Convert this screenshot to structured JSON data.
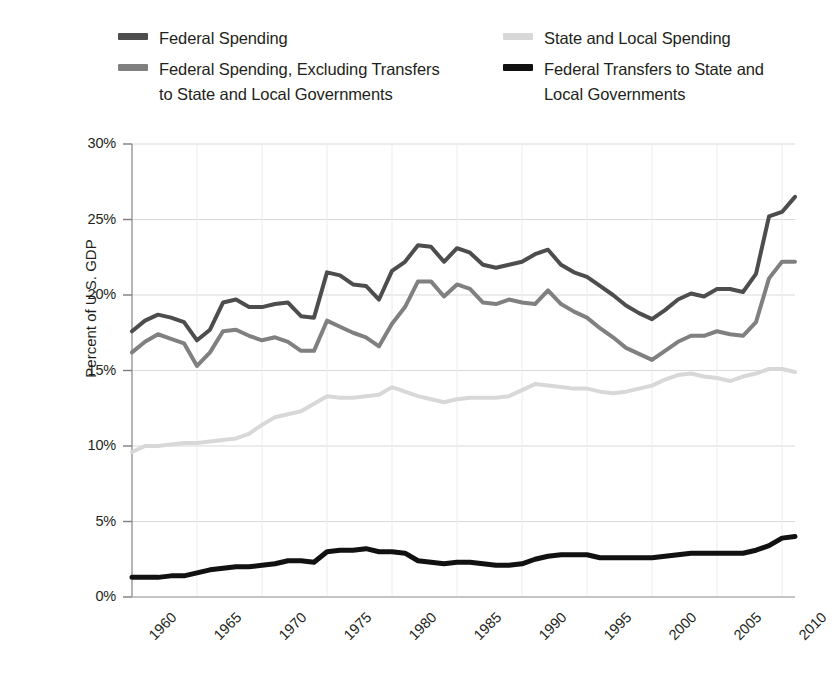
{
  "legend": {
    "columns": [
      {
        "entries": [
          {
            "label": "Federal Spending",
            "color": "#4d4d4d",
            "name": "federal-spending"
          },
          {
            "label": "Federal Spending, Excluding Transfers\nto State and Local Governments",
            "color": "#808080",
            "name": "federal-spending-excluding-transfers"
          }
        ]
      },
      {
        "entries": [
          {
            "label": "State and Local Spending",
            "color": "#d8d8d8",
            "name": "state-and-local-spending"
          },
          {
            "label": "Federal Transfers to State and\nLocal Governments",
            "color": "#111111",
            "name": "federal-transfers-to-state-and-local"
          }
        ]
      }
    ]
  },
  "chart_data": {
    "type": "line",
    "title": "",
    "xlabel": "",
    "ylabel": "Percent of U.S. GDP",
    "xlim": [
      1960,
      2011
    ],
    "ylim": [
      0,
      30
    ],
    "ytick_labels": [
      "30%",
      "25%",
      "20%",
      "15%",
      "10%",
      "5%",
      "0%"
    ],
    "ytick_values": [
      30,
      25,
      20,
      15,
      10,
      5,
      0
    ],
    "xtick_labels": [
      "1960",
      "1965",
      "1970",
      "1975",
      "1980",
      "1985",
      "1990",
      "1995",
      "2000",
      "2005",
      "2010"
    ],
    "xtick_values": [
      1960,
      1965,
      1970,
      1975,
      1980,
      1985,
      1990,
      1995,
      2000,
      2005,
      2010
    ],
    "grid": true,
    "legend_position": "above",
    "x": [
      1960,
      1961,
      1962,
      1963,
      1964,
      1965,
      1966,
      1967,
      1968,
      1969,
      1970,
      1971,
      1972,
      1973,
      1974,
      1975,
      1976,
      1977,
      1978,
      1979,
      1980,
      1981,
      1982,
      1983,
      1984,
      1985,
      1986,
      1987,
      1988,
      1989,
      1990,
      1991,
      1992,
      1993,
      1994,
      1995,
      1996,
      1997,
      1998,
      1999,
      2000,
      2001,
      2002,
      2003,
      2004,
      2005,
      2006,
      2007,
      2008,
      2009,
      2010,
      2011
    ],
    "series": [
      {
        "name": "Federal Spending",
        "color": "#4d4d4d",
        "width": 4,
        "values": [
          17.6,
          18.3,
          18.7,
          18.5,
          18.2,
          17.0,
          17.7,
          19.5,
          19.7,
          19.2,
          19.2,
          19.4,
          19.5,
          18.6,
          18.5,
          21.5,
          21.3,
          20.7,
          20.6,
          19.7,
          21.6,
          22.2,
          23.3,
          23.2,
          22.2,
          23.1,
          22.8,
          22.0,
          21.8,
          22.0,
          22.2,
          22.7,
          23.0,
          22.0,
          21.5,
          21.2,
          20.6,
          20.0,
          19.3,
          18.8,
          18.4,
          19.0,
          19.7,
          20.1,
          19.9,
          20.4,
          20.4,
          20.2,
          21.4,
          25.2,
          25.5,
          26.5
        ]
      },
      {
        "name": "Federal Spending, Excluding Transfers to State and Local Governments",
        "color": "#808080",
        "width": 4,
        "values": [
          16.2,
          16.9,
          17.4,
          17.1,
          16.8,
          15.3,
          16.2,
          17.6,
          17.7,
          17.3,
          17.0,
          17.2,
          16.9,
          16.3,
          16.3,
          18.3,
          17.9,
          17.5,
          17.2,
          16.6,
          18.1,
          19.2,
          20.9,
          20.9,
          19.9,
          20.7,
          20.4,
          19.5,
          19.4,
          19.7,
          19.5,
          19.4,
          20.3,
          19.4,
          18.9,
          18.5,
          17.8,
          17.2,
          16.5,
          16.1,
          15.7,
          16.3,
          16.9,
          17.3,
          17.3,
          17.6,
          17.4,
          17.3,
          18.2,
          21.1,
          22.2,
          22.2
        ]
      },
      {
        "name": "State and Local Spending",
        "color": "#d8d8d8",
        "width": 4,
        "values": [
          9.6,
          10.0,
          10.0,
          10.1,
          10.2,
          10.2,
          10.3,
          10.4,
          10.5,
          10.8,
          11.4,
          11.9,
          12.1,
          12.3,
          12.8,
          13.3,
          13.2,
          13.2,
          13.3,
          13.4,
          13.9,
          13.6,
          13.3,
          13.1,
          12.9,
          13.1,
          13.2,
          13.2,
          13.2,
          13.3,
          13.7,
          14.1,
          14.0,
          13.9,
          13.8,
          13.8,
          13.6,
          13.5,
          13.6,
          13.8,
          14.0,
          14.4,
          14.7,
          14.8,
          14.6,
          14.5,
          14.3,
          14.6,
          14.8,
          15.1,
          15.1,
          14.9
        ]
      },
      {
        "name": "Federal Transfers to State and Local Governments",
        "color": "#111111",
        "width": 5,
        "values": [
          1.3,
          1.3,
          1.3,
          1.4,
          1.4,
          1.6,
          1.8,
          1.9,
          2.0,
          2.0,
          2.1,
          2.2,
          2.4,
          2.4,
          2.3,
          3.0,
          3.1,
          3.1,
          3.2,
          3.0,
          3.0,
          2.9,
          2.4,
          2.3,
          2.2,
          2.3,
          2.3,
          2.2,
          2.1,
          2.1,
          2.2,
          2.5,
          2.7,
          2.8,
          2.8,
          2.8,
          2.6,
          2.6,
          2.6,
          2.6,
          2.6,
          2.7,
          2.8,
          2.9,
          2.9,
          2.9,
          2.9,
          2.9,
          3.1,
          3.4,
          3.9,
          4.0
        ]
      }
    ]
  }
}
